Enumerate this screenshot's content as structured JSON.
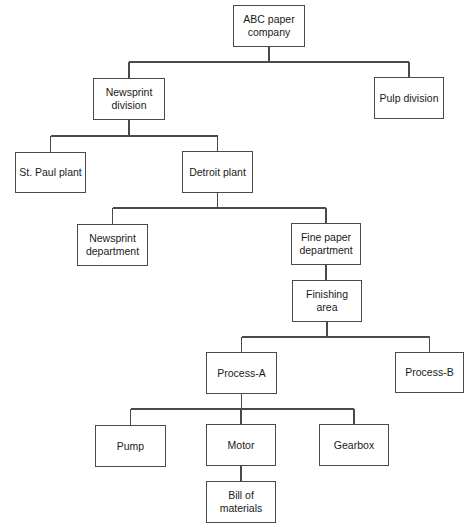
{
  "diagram": {
    "type": "hierarchy / organization chart",
    "nodes": [
      {
        "id": "abc",
        "label": "ABC paper\ncompany",
        "parent": null,
        "box": [
          233,
          5,
          72,
          42
        ]
      },
      {
        "id": "newsdiv",
        "label": "Newsprint\ndivision",
        "parent": "abc",
        "box": [
          93,
          78,
          72,
          42
        ]
      },
      {
        "id": "pulp",
        "label": "Pulp division",
        "parent": "abc",
        "box": [
          374,
          77,
          70,
          42
        ]
      },
      {
        "id": "stpaul",
        "label": "St. Paul plant",
        "parent": "newsdiv",
        "box": [
          15,
          152,
          71,
          41
        ]
      },
      {
        "id": "detroit",
        "label": "Detroit plant",
        "parent": "newsdiv",
        "box": [
          182,
          151,
          71,
          42
        ]
      },
      {
        "id": "newsdept",
        "label": "Newsprint\ndepartment",
        "parent": "detroit",
        "box": [
          77,
          224,
          71,
          42
        ]
      },
      {
        "id": "finedept",
        "label": "Fine paper\ndepartment",
        "parent": "detroit",
        "box": [
          291,
          223,
          70,
          42
        ]
      },
      {
        "id": "finishing",
        "label": "Finishing\narea",
        "parent": "finedept",
        "box": [
          292,
          280,
          70,
          42
        ]
      },
      {
        "id": "procA",
        "label": "Process-A",
        "parent": "finishing",
        "box": [
          206,
          352,
          71,
          42
        ]
      },
      {
        "id": "procB",
        "label": "Process-B",
        "parent": "finishing",
        "box": [
          395,
          352,
          69,
          41
        ]
      },
      {
        "id": "pump",
        "label": "Pump",
        "parent": "procA",
        "box": [
          95,
          425,
          71,
          42
        ]
      },
      {
        "id": "motor",
        "label": "Motor",
        "parent": "procA",
        "box": [
          206,
          424,
          70,
          42
        ]
      },
      {
        "id": "gearbox",
        "label": "Gearbox",
        "parent": "procA",
        "box": [
          319,
          424,
          70,
          42
        ]
      },
      {
        "id": "bom",
        "label": "Bill of\nmaterials",
        "parent": "motor",
        "box": [
          206,
          481,
          70,
          42
        ]
      }
    ],
    "connectors": [
      {
        "from": "abc",
        "bus_y": 62,
        "to": [
          "newsdiv",
          "pulp"
        ]
      },
      {
        "from": "newsdiv",
        "bus_y": 136,
        "to": [
          "stpaul",
          "detroit"
        ]
      },
      {
        "from": "detroit",
        "bus_y": 208,
        "to": [
          "newsdept",
          "finedept"
        ]
      },
      {
        "from": "finedept",
        "bus_y": null,
        "to": [
          "finishing"
        ]
      },
      {
        "from": "finishing",
        "bus_y": 337,
        "to": [
          "procA",
          "procB"
        ]
      },
      {
        "from": "procA",
        "bus_y": 409,
        "to": [
          "pump",
          "motor",
          "gearbox"
        ]
      },
      {
        "from": "motor",
        "bus_y": null,
        "to": [
          "bom"
        ]
      }
    ],
    "colors": {
      "line": "#4a4a4a",
      "border": "#4a4a4a",
      "text": "#1a1a1a",
      "background": "#ffffff"
    }
  },
  "labels": {
    "abc": "ABC paper\ncompany",
    "newsdiv": "Newsprint\ndivision",
    "pulp": "Pulp division",
    "stpaul": "St. Paul plant",
    "detroit": "Detroit plant",
    "newsdept": "Newsprint\ndepartment",
    "finedept": "Fine paper\ndepartment",
    "finishing": "Finishing\narea",
    "procA": "Process-A",
    "procB": "Process-B",
    "pump": "Pump",
    "motor": "Motor",
    "gearbox": "Gearbox",
    "bom": "Bill of\nmaterials"
  }
}
